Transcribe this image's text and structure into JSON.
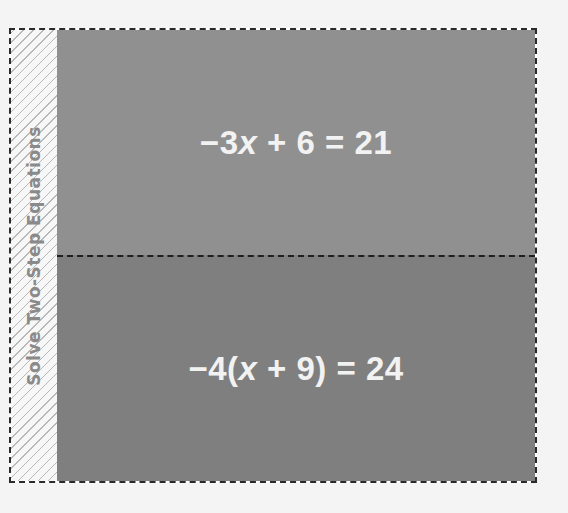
{
  "foldable": {
    "tab_title": "Solve Two-Step Equations",
    "panels": [
      {
        "equation": "−3x + 6 = 21",
        "parts": {
          "pre": "−3",
          "var": "x",
          "post": " + 6 = 21"
        },
        "color": "#909090"
      },
      {
        "equation": "−4(x + 9) = 24",
        "parts": {
          "pre": "−4(",
          "var": "x",
          "post": " + 9) = 24"
        },
        "color": "#7f7f7f"
      }
    ]
  },
  "colors": {
    "background": "#f4f4f4",
    "border": "#2a2a2a",
    "tab_text": "#8a8a8a",
    "equation_text": "#f2f2f2"
  }
}
